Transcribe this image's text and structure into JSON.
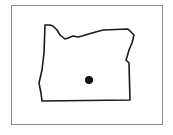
{
  "map": {
    "region": "Oregon",
    "description": "Outline map of the state of Oregon with a single location marker",
    "frame_color": "#8a8a8a",
    "outline_color": "#1a1a1a",
    "marker_color": "#111111",
    "marker": {
      "cx": 89,
      "cy": 80,
      "r": 4
    }
  }
}
